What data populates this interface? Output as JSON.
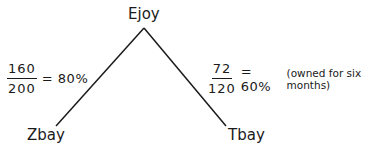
{
  "diagram": {
    "nodes": {
      "top": {
        "label": "Ejoy"
      },
      "left": {
        "label": "Zbay"
      },
      "right": {
        "label": "Tbay"
      }
    },
    "edges": {
      "left": {
        "numerator": "160",
        "denominator": "200",
        "result": "= 80%",
        "note": ""
      },
      "right": {
        "numerator": "72",
        "denominator": "120",
        "result": "= 60%",
        "note": "(owned for six months)"
      }
    }
  }
}
